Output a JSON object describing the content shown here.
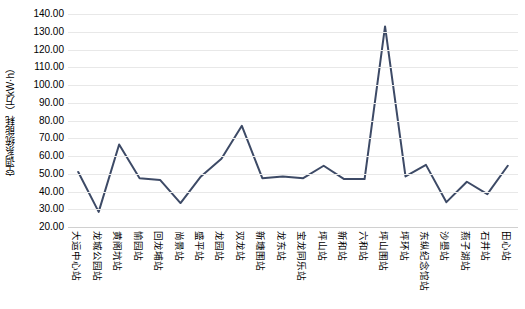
{
  "chart_data": {
    "type": "line",
    "title": "",
    "xlabel": "",
    "ylabel": "空调系统能耗（万kW·h）",
    "ylim": [
      20.0,
      140.0
    ],
    "ytick_step": 10.0,
    "ytick_labels": [
      "140.00",
      "130.00",
      "120.00",
      "110.00",
      "100.00",
      "90.00",
      "80.00",
      "70.00",
      "60.00",
      "50.00",
      "40.00",
      "30.00",
      "20.00"
    ],
    "grid": true,
    "legend": "none",
    "series_color": "#3d4a66",
    "line_width": 2,
    "markers": false,
    "categories": [
      "大运中心站",
      "龙城公园站",
      "黄阁坑站",
      "愉园站",
      "回龙埔站",
      "尚景站",
      "盛平站",
      "龙园站",
      "双龙站",
      "新塘围站",
      "龙东站",
      "宝龙同乐站",
      "坪山站",
      "新和站",
      "六和站",
      "坪山围站",
      "坪环站",
      "东纵纪念馆站",
      "沙壆站",
      "燕子湖站",
      "石井站",
      "田心站"
    ],
    "values": [
      51.0,
      28.5,
      66.5,
      47.5,
      46.5,
      33.5,
      48.5,
      58.5,
      77.0,
      47.5,
      48.5,
      47.5,
      54.5,
      47.0,
      47.0,
      133.0,
      48.5,
      55.0,
      34.0,
      45.5,
      38.5,
      54.5
    ]
  }
}
